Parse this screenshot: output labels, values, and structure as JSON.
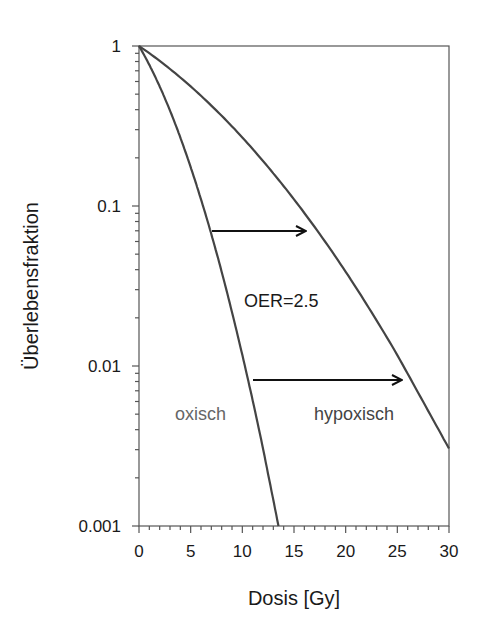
{
  "chart_data": {
    "type": "line",
    "title": "",
    "xlabel": "Dosis [Gy]",
    "ylabel": "Überlebensfraktion",
    "xlim": [
      0,
      30
    ],
    "ylim": [
      0.001,
      1
    ],
    "yscale": "log",
    "grid": false,
    "legend": null,
    "x_ticks": [
      0,
      5,
      10,
      15,
      20,
      25,
      30
    ],
    "x_tick_labels": [
      "0",
      "5",
      "10",
      "15",
      "20",
      "25",
      "30"
    ],
    "y_ticks": [
      1,
      0.1,
      0.01,
      0.001
    ],
    "y_tick_labels": [
      "1",
      "0.1",
      "0.01",
      "0.001"
    ],
    "series": [
      {
        "name": "oxisch",
        "color": "#444444",
        "x": [
          0,
          2,
          4,
          6,
          8,
          10,
          12,
          13.5
        ],
        "values": [
          1,
          0.559,
          0.268,
          0.11,
          0.0388,
          0.0117,
          0.00305,
          0.001
        ]
      },
      {
        "name": "hypoxisch",
        "color": "#444444",
        "x": [
          0,
          5,
          10,
          15,
          20,
          25,
          30
        ],
        "values": [
          1,
          0.559,
          0.268,
          0.11,
          0.0388,
          0.0117,
          0.00305
        ]
      }
    ],
    "annotations": [
      {
        "text": "OER=2.5",
        "x": 10.5,
        "y": 0.025,
        "color": "#1a1a1a"
      },
      {
        "text": "oxisch",
        "x": 3.5,
        "y": 0.0055,
        "color": "#666666"
      },
      {
        "text": "hypoxisch",
        "x": 17.3,
        "y": 0.0055,
        "color": "#444444"
      }
    ],
    "arrows": [
      {
        "from": [
          7.0,
          0.07
        ],
        "to": [
          16.5,
          0.07
        ]
      },
      {
        "from": [
          11.0,
          0.008
        ],
        "to": [
          26.0,
          0.008
        ]
      }
    ]
  },
  "labels": {
    "xlabel": "Dosis [Gy]",
    "ylabel": "Überlebensfraktion",
    "oer": "OER=2.5",
    "oxic": "oxisch",
    "hypoxic": "hypoxisch",
    "xticks": [
      "0",
      "5",
      "10",
      "15",
      "20",
      "25",
      "30"
    ],
    "yticks": [
      "1",
      "0.1",
      "0.01",
      "0.001"
    ]
  }
}
